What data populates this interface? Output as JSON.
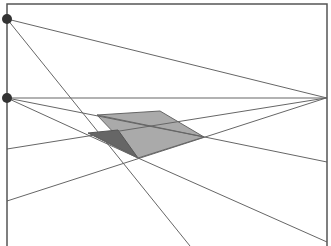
{
  "diagram": {
    "frame": {
      "x1": 7,
      "y1": 4,
      "x2": 327,
      "y2": 246,
      "stroke": "#555555"
    },
    "vanishing_points": [
      {
        "name": "vp-top-left",
        "x": 7,
        "y": 19,
        "r": 5,
        "fill": "#333333"
      },
      {
        "name": "vp-left-horizon",
        "x": 7,
        "y": 98,
        "r": 5,
        "fill": "#333333"
      },
      {
        "name": "vp-right-horizon",
        "x": 326,
        "y": 98,
        "r": 0,
        "fill": "#333333"
      }
    ],
    "horizon_line": {
      "x1": 7,
      "y1": 98,
      "x2": 327,
      "y2": 98
    },
    "lines": [
      {
        "x1": 7,
        "y1": 19,
        "x2": 327,
        "y2": 98
      },
      {
        "x1": 7,
        "y1": 19,
        "x2": 190,
        "y2": 246
      },
      {
        "x1": 7,
        "y1": 98,
        "x2": 204,
        "y2": 137
      },
      {
        "x1": 7,
        "y1": 98,
        "x2": 138,
        "y2": 158
      },
      {
        "x1": 7,
        "y1": 149,
        "x2": 326,
        "y2": 98
      },
      {
        "x1": 7,
        "y1": 201,
        "x2": 326,
        "y2": 98
      },
      {
        "x1": 97,
        "y1": 115,
        "x2": 327,
        "y2": 162
      },
      {
        "x1": 138,
        "y1": 158,
        "x2": 327,
        "y2": 242
      }
    ],
    "shapes": [
      {
        "name": "top-face",
        "points": "97,115 160,111 204,137 138,158",
        "fill": "#aaaaaa",
        "stroke": "#666666"
      },
      {
        "name": "side-face",
        "points": "88,133 118,130 138,158",
        "fill": "#666666",
        "stroke": "#555555"
      }
    ],
    "line_color": "#666666"
  }
}
